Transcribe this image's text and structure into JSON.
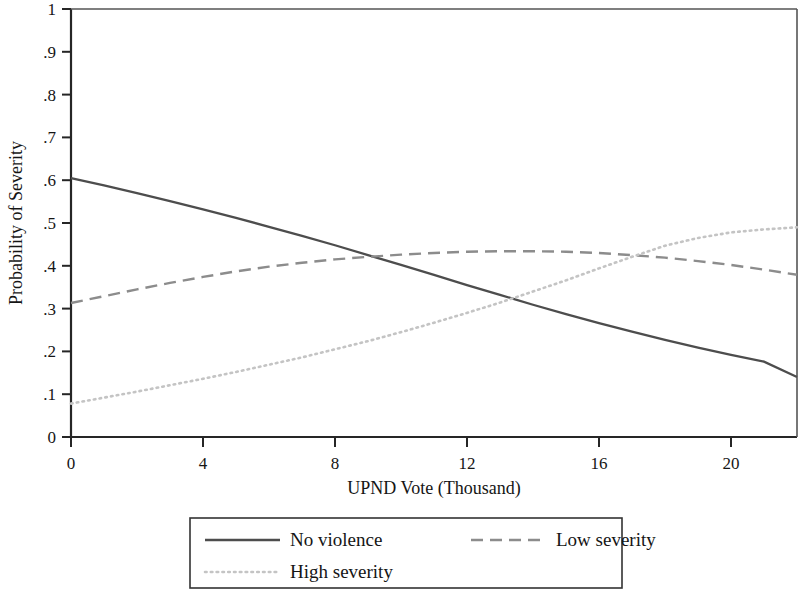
{
  "chart_data": {
    "type": "line",
    "title": "",
    "xlabel": "UPND Vote (Thousand)",
    "ylabel": "Probability of Severity",
    "xlim": [
      0,
      22
    ],
    "ylim": [
      0,
      1
    ],
    "xticks": [
      "0",
      "4",
      "8",
      "12",
      "16",
      "20"
    ],
    "xtick_values": [
      0,
      4,
      8,
      12,
      16,
      20
    ],
    "yticks": [
      "0",
      ".1",
      ".2",
      ".3",
      ".4",
      ".5",
      ".6",
      ".7",
      ".8",
      ".9",
      "1"
    ],
    "ytick_values": [
      0,
      0.1,
      0.2,
      0.3,
      0.4,
      0.5,
      0.6,
      0.7,
      0.8,
      0.9,
      1
    ],
    "grid": false,
    "legend_position": "bottom",
    "series": [
      {
        "name": "No violence",
        "style": "solid",
        "color": "#4d4d4d",
        "x": [
          0,
          1,
          2,
          3,
          4,
          5,
          6,
          7,
          8,
          9,
          10,
          11,
          12,
          13,
          14,
          15,
          16,
          17,
          18,
          19,
          20,
          21,
          22
        ],
        "values": [
          0.605,
          0.588,
          0.57,
          0.551,
          0.532,
          0.512,
          0.491,
          0.47,
          0.448,
          0.425,
          0.402,
          0.379,
          0.355,
          0.332,
          0.309,
          0.287,
          0.266,
          0.246,
          0.227,
          0.209,
          0.192,
          0.176,
          0.14
        ]
      },
      {
        "name": "Low severity",
        "style": "dashed",
        "color": "#8c8c8c",
        "x": [
          0,
          1,
          2,
          3,
          4,
          5,
          6,
          7,
          8,
          9,
          10,
          11,
          12,
          13,
          14,
          15,
          16,
          17,
          18,
          19,
          20,
          21,
          22
        ],
        "values": [
          0.313,
          0.329,
          0.345,
          0.36,
          0.374,
          0.387,
          0.398,
          0.407,
          0.415,
          0.421,
          0.426,
          0.43,
          0.433,
          0.434,
          0.434,
          0.433,
          0.43,
          0.425,
          0.419,
          0.411,
          0.402,
          0.391,
          0.379
        ]
      },
      {
        "name": "High severity",
        "style": "dotted",
        "color": "#c4c4c4",
        "x": [
          0,
          1,
          2,
          3,
          4,
          5,
          6,
          7,
          8,
          9,
          10,
          11,
          12,
          13,
          14,
          15,
          16,
          17,
          18,
          19,
          20,
          21,
          22
        ],
        "values": [
          0.078,
          0.092,
          0.106,
          0.121,
          0.136,
          0.152,
          0.169,
          0.186,
          0.205,
          0.224,
          0.245,
          0.267,
          0.29,
          0.314,
          0.34,
          0.366,
          0.394,
          0.421,
          0.447,
          0.465,
          0.478,
          0.485,
          0.49
        ]
      }
    ],
    "annotations": []
  },
  "legend": {
    "items": [
      {
        "label": "No violence",
        "style": "solid"
      },
      {
        "label": "Low severity",
        "style": "dashed"
      },
      {
        "label": "High severity",
        "style": "dotted"
      }
    ]
  }
}
